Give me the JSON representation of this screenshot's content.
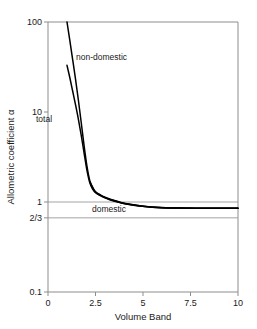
{
  "chart_data": {
    "type": "line",
    "title": "",
    "xlabel": "Volume Band",
    "ylabel": "Allometric coefficient α",
    "xlim": [
      0,
      10
    ],
    "ylim": [
      0.1,
      100
    ],
    "yscale": "log",
    "xscale": "linear",
    "grid": "horizontal reference lines at 1 and 2/3 only",
    "legend": "inline annotations on curves",
    "xticks": [
      "0",
      "2.5",
      "5",
      "7.5",
      "10"
    ],
    "xtick_values": [
      0,
      2.5,
      5,
      7.5,
      10
    ],
    "yticks": [
      "100",
      "10",
      "1",
      "2/3",
      "0.1"
    ],
    "ytick_values": [
      100,
      10,
      1,
      0.6667,
      0.1
    ],
    "reference_lines": [
      {
        "name": "unity-line",
        "value": 1,
        "label": "1"
      },
      {
        "name": "two-thirds-line",
        "value": 0.6667,
        "label": "2/3"
      }
    ],
    "series": [
      {
        "name": "non-domestic",
        "label": "non-domestic",
        "color": "#000000",
        "x": [
          1.0,
          1.15,
          1.3,
          1.45,
          1.6,
          1.75,
          1.9,
          2.05,
          2.2,
          2.35,
          2.5,
          2.75,
          3.0,
          3.25,
          3.5,
          3.75,
          4.0,
          4.5,
          5.0,
          5.5,
          6.0,
          6.5,
          7.0,
          7.5,
          8.0,
          8.5,
          9.0,
          9.5,
          10.0
        ],
        "y": [
          100.0,
          62.0,
          38.0,
          23.0,
          13.5,
          7.6,
          4.2,
          2.5,
          1.72,
          1.43,
          1.3,
          1.2,
          1.13,
          1.08,
          1.04,
          1.0,
          0.97,
          0.93,
          0.9,
          0.878,
          0.866,
          0.86,
          0.857,
          0.855,
          0.853,
          0.852,
          0.851,
          0.85,
          0.85
        ]
      },
      {
        "name": "total",
        "label": "total",
        "color": "#000000",
        "x": [
          1.0,
          1.15,
          1.3,
          1.45,
          1.6,
          1.75,
          1.9,
          2.05,
          2.2,
          2.35,
          2.5,
          2.75,
          3.0,
          3.25,
          3.5,
          3.75,
          4.0,
          4.5,
          5.0,
          5.5,
          6.0,
          6.5,
          7.0,
          7.5,
          8.0,
          8.5,
          9.0,
          9.5,
          10.0
        ],
        "y": [
          33.0,
          24.0,
          17.0,
          12.0,
          8.3,
          5.5,
          3.5,
          2.25,
          1.64,
          1.39,
          1.27,
          1.18,
          1.11,
          1.06,
          1.02,
          0.99,
          0.96,
          0.92,
          0.895,
          0.875,
          0.864,
          0.859,
          0.856,
          0.854,
          0.8525,
          0.8515,
          0.851,
          0.85,
          0.85
        ]
      },
      {
        "name": "domestic",
        "label": "domestic",
        "color": "#000000",
        "x": [
          2.2,
          2.5,
          2.75,
          3.0,
          3.25,
          3.5,
          3.75,
          4.0,
          4.5,
          5.0,
          5.5,
          6.0,
          6.5,
          7.0,
          7.5,
          8.0,
          8.5,
          9.0,
          9.5,
          10.0
        ],
        "y": [
          1.68,
          1.29,
          1.19,
          1.12,
          1.07,
          1.03,
          0.995,
          0.965,
          0.925,
          0.897,
          0.876,
          0.865,
          0.859,
          0.856,
          0.854,
          0.8525,
          0.8515,
          0.851,
          0.85,
          0.85
        ]
      }
    ],
    "annotations": [
      {
        "name": "non-domestic-annotation",
        "text": "non-domestic",
        "x_px": 76,
        "y_px": 60
      },
      {
        "name": "total-annotation",
        "text": "total",
        "x_px": 36,
        "y_px": 122
      },
      {
        "name": "domestic-annotation",
        "text": "domestic",
        "x_px": 92,
        "y_px": 212
      }
    ],
    "style": {
      "axis_color": "#808080",
      "line_color": "#000000",
      "gridline_color": "#999999",
      "background": "#ffffff",
      "plot_background": "#ffffff"
    }
  }
}
